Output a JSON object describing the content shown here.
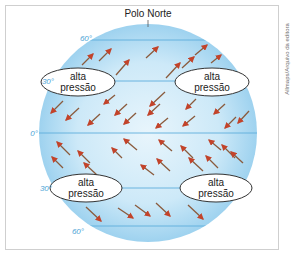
{
  "diagram": {
    "title_label": "Polo Norte",
    "credit": "Allmaps/Arquivo da editora",
    "colors": {
      "globe_center": "#e6f4fb",
      "globe_edge": "#9fd3f0",
      "latitude_line": "#5eaedb",
      "latitude_label": "#4aa3d6",
      "arrow_shaft": "#8a5a3c",
      "arrow_head": "#c2432a",
      "ellipse_fill": "#ffffff",
      "ellipse_stroke": "#333333"
    },
    "latitudes": [
      {
        "label": "60°",
        "y": 40
      },
      {
        "label": "30°",
        "y": 81
      },
      {
        "label": "0°",
        "y": 133
      },
      {
        "label": "30°",
        "y": 188
      },
      {
        "label": "60°",
        "y": 226
      }
    ],
    "high_pressure_zones": [
      {
        "line1": "alta",
        "line2": "pressão",
        "position": "north-west"
      },
      {
        "line1": "alta",
        "line2": "pressão",
        "position": "north-east"
      },
      {
        "line1": "alta",
        "line2": "pressão",
        "position": "south-west"
      },
      {
        "line1": "alta",
        "line2": "pressão",
        "position": "south-east"
      }
    ],
    "wind_bands": [
      {
        "band": "30°N-60°N",
        "direction": "south-west to north-east (westerlies)"
      },
      {
        "band": "0°-30°N",
        "direction": "north-east to south-west (NE trade winds)"
      },
      {
        "band": "0°-30°S",
        "direction": "south-east to north-west (SE trade winds)"
      },
      {
        "band": "30°S-60°S",
        "direction": "north-west to south-east (westerlies)"
      }
    ]
  }
}
